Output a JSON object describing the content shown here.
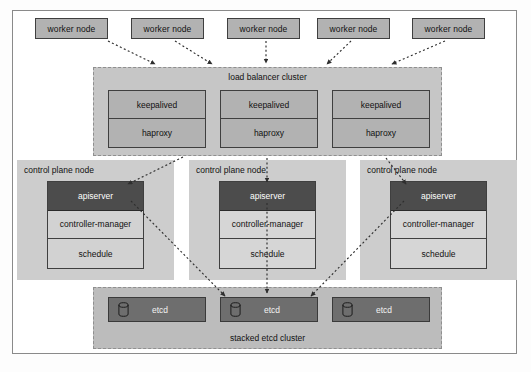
{
  "diagram": {
    "caption": "",
    "colors": {
      "page_background": "#fdfdfd",
      "frame_background": "#ffffff",
      "frame_border": "#8a8a8a",
      "worker_node_fill": "#b2b2b2",
      "worker_node_border": "#3f3f3f",
      "lb_cluster_fill": "#c6c6c6",
      "lb_cluster_border": "#8f8f8f",
      "lb_box_fill": "#b2b2b2",
      "control_plane_fill": "#cdcdcd",
      "apiserver_fill": "#4c4c4c",
      "apiserver_text": "#ffffff",
      "component_fill": "#d2d2d2",
      "etcd_cluster_fill": "#bcbcbc",
      "etcd_box_fill": "#6e6e6e",
      "etcd_text": "#f2f2f2",
      "connector": "#3a3a3a"
    },
    "worker_nodes": [
      {
        "label": "worker node",
        "x": 35,
        "y": 18,
        "w": 73
      },
      {
        "label": "worker node",
        "x": 131,
        "y": 18,
        "w": 73
      },
      {
        "label": "worker node",
        "x": 227,
        "y": 18,
        "w": 73
      },
      {
        "label": "worker node",
        "x": 317,
        "y": 18,
        "w": 73
      },
      {
        "label": "worker node",
        "x": 412,
        "y": 18,
        "w": 73
      }
    ],
    "load_balancer_cluster": {
      "label": "load balancer cluster",
      "members": [
        {
          "top_label": "keepalived",
          "bottom_label": "haproxy",
          "x": 14
        },
        {
          "top_label": "keepalived",
          "bottom_label": "haproxy",
          "x": 126
        },
        {
          "top_label": "keepalived",
          "bottom_label": "haproxy",
          "x": 238
        }
      ]
    },
    "control_plane_nodes": [
      {
        "label": "control plane node",
        "x": 17,
        "components": [
          {
            "name": "apiserver"
          },
          {
            "name": "controller-manager"
          },
          {
            "name": "schedule"
          }
        ]
      },
      {
        "label": "control plane node",
        "x": 189,
        "components": [
          {
            "name": "apiserver"
          },
          {
            "name": "controller-manager"
          },
          {
            "name": "schedule"
          }
        ]
      },
      {
        "label": "control plane node",
        "x": 360,
        "components": [
          {
            "name": "apiserver"
          },
          {
            "name": "controller-manager"
          },
          {
            "name": "schedule"
          }
        ]
      }
    ],
    "etcd_cluster": {
      "label": "stacked etcd cluster",
      "members": [
        {
          "label": "etcd",
          "icon": "database-cylinder-icon",
          "x": 14
        },
        {
          "label": "etcd",
          "icon": "database-cylinder-icon",
          "x": 126
        },
        {
          "label": "etcd",
          "icon": "database-cylinder-icon",
          "x": 238
        }
      ]
    },
    "connectors": {
      "style": "dotted",
      "arrowhead": "filled-triangle",
      "edges": [
        {
          "from": "worker-node-1",
          "to": "load-balancer-cluster"
        },
        {
          "from": "worker-node-2",
          "to": "load-balancer-cluster"
        },
        {
          "from": "worker-node-3",
          "to": "load-balancer-cluster"
        },
        {
          "from": "worker-node-4",
          "to": "load-balancer-cluster"
        },
        {
          "from": "worker-node-5",
          "to": "load-balancer-cluster"
        },
        {
          "from": "load-balancer-cluster",
          "to": "apiserver-1"
        },
        {
          "from": "load-balancer-cluster",
          "to": "apiserver-2"
        },
        {
          "from": "load-balancer-cluster",
          "to": "apiserver-3"
        },
        {
          "from": "apiserver-1",
          "to": "etcd-2"
        },
        {
          "from": "apiserver-2",
          "to": "etcd-2"
        },
        {
          "from": "apiserver-3",
          "to": "etcd-2"
        }
      ]
    }
  }
}
